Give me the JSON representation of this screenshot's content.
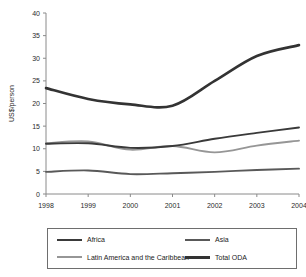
{
  "chart_data": {
    "type": "line",
    "title": "",
    "xlabel": "",
    "ylabel": "US$/person",
    "x": [
      1998,
      1999,
      2000,
      2001,
      2002,
      2003,
      2004
    ],
    "xlim": [
      1998,
      2004
    ],
    "ylim": [
      0,
      40
    ],
    "yticks": [
      0,
      5,
      10,
      15,
      20,
      25,
      30,
      35,
      40
    ],
    "xticks": [
      "1998",
      "1999",
      "2000",
      "2001",
      "2002",
      "2003",
      "2004"
    ],
    "grid": false,
    "legend_position": "bottom",
    "series": [
      {
        "name": "Africa",
        "color": "#3a3a3a",
        "width": 1.9,
        "values": [
          11.1,
          11.2,
          10.2,
          10.6,
          12.2,
          13.5,
          14.7
        ]
      },
      {
        "name": "Asia",
        "color": "#595959",
        "width": 1.9,
        "values": [
          4.9,
          5.2,
          4.4,
          4.6,
          4.9,
          5.3,
          5.6
        ]
      },
      {
        "name": "Latin America and the Caribbean",
        "color": "#969696",
        "width": 1.9,
        "values": [
          11.2,
          11.6,
          9.8,
          10.6,
          9.2,
          10.7,
          11.8
        ]
      },
      {
        "name": "Total ODA",
        "color": "#333333",
        "width": 2.6,
        "values": [
          23.4,
          21.0,
          19.8,
          19.5,
          25.0,
          30.5,
          32.9
        ]
      }
    ]
  },
  "axis": {
    "y_title": "US$/person",
    "y_tick_labels": [
      "0",
      "5",
      "10",
      "15",
      "20",
      "25",
      "30",
      "35",
      "40"
    ],
    "x_tick_labels": [
      "1998",
      "1999",
      "2000",
      "2001",
      "2002",
      "2003",
      "2004"
    ]
  },
  "legend": {
    "entries": [
      {
        "label": "Africa",
        "color": "#3a3a3a",
        "width": 2.4
      },
      {
        "label": "Asia",
        "color": "#595959",
        "width": 2.4
      },
      {
        "label": "Latin America and the Caribbean",
        "color": "#969696",
        "width": 2.4
      },
      {
        "label": "Total ODA",
        "color": "#333333",
        "width": 3.2
      }
    ]
  }
}
